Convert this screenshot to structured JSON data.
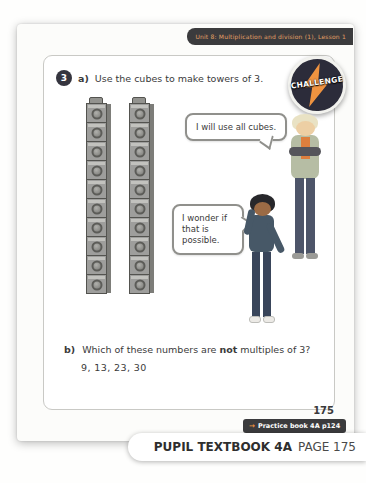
{
  "header": {
    "tab_label": "Unit 8: Multiplication and division (1), Lesson 1"
  },
  "question": {
    "number": "3",
    "part_a": {
      "label": "a)",
      "text": "Use the cubes to make towers of 3."
    },
    "part_b": {
      "label": "b)",
      "text_before": "Which of these numbers are ",
      "emphasis": "not",
      "text_after": " multiples of 3?",
      "numbers": "9, 13, 23, 30"
    }
  },
  "challenge_badge": {
    "label": "CHALLENGE"
  },
  "bubbles": {
    "boy_bubble": "I will use all cubes.",
    "girl_bubble": "I wonder if that is possible."
  },
  "towers": {
    "count": 2,
    "cubes_per_tower": 10
  },
  "footer": {
    "page_number": "175",
    "practice_arrow": "→",
    "practice_label": "Practice book 4A p124",
    "bottom_bar_bold": "PUPIL TEXTBOOK 4A",
    "bottom_bar_regular": "PAGE 175"
  },
  "colors": {
    "dark_charcoal": "#3b3b3d",
    "badge_navy": "#2c2c3a",
    "accent_orange": "#ef9340",
    "tab_text_orange": "#e3a066",
    "cube_grey": "#9e9e9c",
    "card_border": "#c9c9c5"
  }
}
